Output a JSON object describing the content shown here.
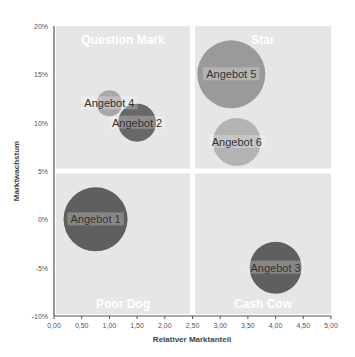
{
  "chart_data": {
    "type": "bubble",
    "title": "",
    "xlabel": "Relativer Marktanteil",
    "ylabel": "Marktwachstum",
    "xlim": [
      0,
      5
    ],
    "ylim": [
      -10,
      20
    ],
    "x_ticks": [
      "0,00",
      "0,50",
      "1,00",
      "1,50",
      "2,00",
      "2,50",
      "3,00",
      "3,50",
      "4,00",
      "4,50",
      "5,00"
    ],
    "y_ticks": [
      "20%",
      "15%",
      "10%",
      "5%",
      "0%",
      "-5%",
      "-10%"
    ],
    "grid": false,
    "legend": "none",
    "quadrants": [
      {
        "label": "Question Mark",
        "position": "top-left"
      },
      {
        "label": "Star",
        "position": "top-right"
      },
      {
        "label": "Poor Dog",
        "position": "bottom-left"
      },
      {
        "label": "Cash Cow",
        "position": "bottom-right"
      }
    ],
    "quadrant_split": {
      "x": 2.5,
      "y": 5
    },
    "series": [
      {
        "name": "Angebot 1",
        "x": 0.75,
        "y": 0,
        "size": 32,
        "color": "#5f5f5f"
      },
      {
        "name": "Angebot 2",
        "x": 1.5,
        "y": 10,
        "size": 19,
        "color": "#686868"
      },
      {
        "name": "Angebot 3",
        "x": 4.0,
        "y": -5,
        "size": 26,
        "color": "#5f5f5f"
      },
      {
        "name": "Angebot 4",
        "x": 1.0,
        "y": 12,
        "size": 13,
        "color": "#a8a8a8"
      },
      {
        "name": "Angebot 5",
        "x": 3.2,
        "y": 15,
        "size": 34,
        "color": "#9a9a9a"
      },
      {
        "name": "Angebot 6",
        "x": 3.3,
        "y": 8,
        "size": 24,
        "color": "#b3b3b3"
      }
    ]
  }
}
